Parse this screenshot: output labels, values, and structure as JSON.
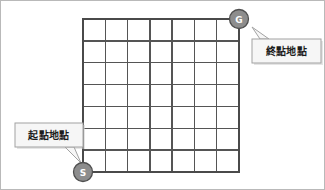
{
  "figure": {
    "name": "grid-maze-start-goal-diagram",
    "background_color": "#ffffff",
    "border_color": "#b9b9b9",
    "width": 325,
    "height": 190
  },
  "grid": {
    "columns": 7,
    "rows": 7,
    "left": 82,
    "top": 18,
    "right": 238,
    "bottom": 171,
    "cell_width": 22.3,
    "cell_height": 21.9,
    "line_color": "#555555",
    "border_color": "#4a4a4a"
  },
  "markers": [
    {
      "id": "goal",
      "label": "G",
      "cx": 238,
      "cy": 18,
      "r": 9.5,
      "fill_color": "#8d8d8d",
      "stroke_color": "#4f4f4f",
      "text_color": "#ffffff"
    },
    {
      "id": "start",
      "label": "S",
      "cx": 82,
      "cy": 171,
      "r": 9.5,
      "fill_color": "#8d8d8d",
      "stroke_color": "#4f4f4f",
      "text_color": "#ffffff"
    }
  ],
  "callouts": [
    {
      "id": "goal-callout",
      "text": "終點地點",
      "box": {
        "x": 251,
        "y": 38,
        "width": 69,
        "height": 24
      },
      "text_x": 285.5,
      "text_y": 50.5,
      "tail_points": "259,38 251,26 268,38",
      "fill_color": "#f6f6f6",
      "stroke_color": "#a2a2a2",
      "text_color": "#1d1d1d"
    },
    {
      "id": "start-callout",
      "text": "起點地點",
      "box": {
        "x": 14,
        "y": 122,
        "width": 68,
        "height": 24
      },
      "text_x": 48,
      "text_y": 134,
      "tail_points": "64,146 80,162 73,146",
      "fill_color": "#f6f6f6",
      "stroke_color": "#a2a2a2",
      "text_color": "#1d1d1d"
    }
  ]
}
